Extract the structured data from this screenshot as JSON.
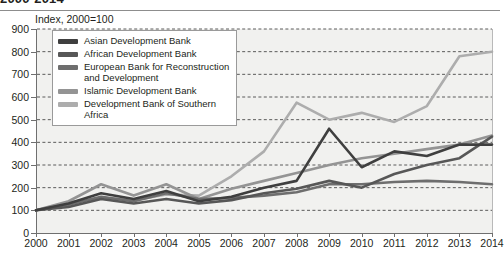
{
  "title": "2000-2014",
  "subtitle": "Index, 2000=100",
  "axis": {
    "y_ticks": [
      0,
      100,
      200,
      300,
      400,
      500,
      600,
      700,
      800,
      900
    ],
    "x_ticks": [
      "2000",
      "2001",
      "2002",
      "2003",
      "2004",
      "2005",
      "2006",
      "2007",
      "2008",
      "2009",
      "2010",
      "2011",
      "2012",
      "2013",
      "2014"
    ]
  },
  "legend": {
    "items": [
      {
        "label": "Asian Development Bank",
        "color": "#3f3f3f"
      },
      {
        "label": "African Development Bank",
        "color": "#575757"
      },
      {
        "label": "European Bank for Reconstruction and Development",
        "color": "#6e6e6e"
      },
      {
        "label": "Islamic Development Bank",
        "color": "#949494"
      },
      {
        "label": "Development Bank of Southern Africa",
        "color": "#adadad"
      }
    ]
  },
  "chart_data": {
    "type": "line",
    "title": "2000-2014",
    "subtitle": "Index, 2000=100",
    "xlabel": "",
    "ylabel": "Index, 2000=100",
    "ylim": [
      0,
      900
    ],
    "ytick_step": 100,
    "grid": "horizontal-dashed",
    "legend_position": "upper-left-inset",
    "x": [
      2000,
      2001,
      2002,
      2003,
      2004,
      2005,
      2006,
      2007,
      2008,
      2009,
      2010,
      2011,
      2012,
      2013,
      2014
    ],
    "series": [
      {
        "name": "Asian Development Bank",
        "color": "#3f3f3f",
        "values": [
          100,
          130,
          175,
          150,
          185,
          140,
          160,
          200,
          230,
          460,
          290,
          360,
          340,
          390,
          390
        ]
      },
      {
        "name": "African Development Bank",
        "color": "#575757",
        "values": [
          100,
          115,
          150,
          130,
          150,
          130,
          145,
          175,
          195,
          230,
          200,
          260,
          300,
          330,
          425
        ]
      },
      {
        "name": "European Bank for Reconstruction and Development",
        "color": "#6e6e6e",
        "values": [
          100,
          125,
          160,
          140,
          175,
          150,
          155,
          165,
          180,
          215,
          215,
          225,
          230,
          225,
          215
        ]
      },
      {
        "name": "Islamic Development Bank",
        "color": "#949494",
        "values": [
          100,
          140,
          215,
          165,
          215,
          150,
          195,
          230,
          265,
          300,
          330,
          350,
          370,
          390,
          430
        ]
      },
      {
        "name": "Development Bank of Southern Africa",
        "color": "#adadad",
        "values": [
          100,
          135,
          155,
          145,
          170,
          165,
          250,
          360,
          575,
          500,
          530,
          490,
          560,
          780,
          800
        ]
      }
    ]
  }
}
